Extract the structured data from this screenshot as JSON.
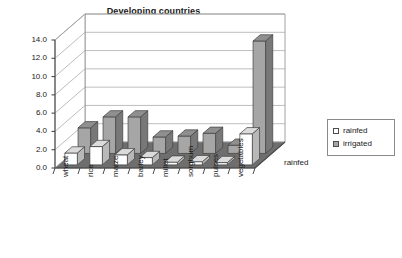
{
  "chart_data": {
    "type": "bar",
    "title": "Developing countries",
    "xlabel": "",
    "ylabel": "",
    "ylim": [
      0.0,
      14.0
    ],
    "ytick_step": 2.0,
    "yticks": [
      "14.0",
      "12.0",
      "10.0",
      "8.0",
      "6.0",
      "4.0",
      "2.0",
      "0.0"
    ],
    "grid": true,
    "projection": "3d-clustered-column",
    "legend_position": "right",
    "depth_axis_label": "rainfed",
    "categories": [
      "wheat",
      "rice",
      "maize",
      "barley",
      "millet",
      "sorghum",
      "pulses",
      "vegetables"
    ],
    "series": [
      {
        "name": "rainfed",
        "color": "#ffffff",
        "values": [
          1.3,
          2.0,
          1.1,
          0.8,
          0.3,
          0.35,
          0.25,
          3.4
        ]
      },
      {
        "name": "irrigated",
        "color": "#a6a6a6",
        "values": [
          2.8,
          4.0,
          4.0,
          1.8,
          1.9,
          2.2,
          0.9,
          12.3
        ]
      }
    ]
  },
  "legend": {
    "items": [
      {
        "label": "rainfed",
        "swatch": "rainfed"
      },
      {
        "label": "irrigated",
        "swatch": "irrigated"
      }
    ]
  },
  "colors": {
    "rainfed": "#ffffff",
    "irrigated": "#a6a6a6",
    "floor": "#6e6e6e",
    "wall": "#ffffff",
    "grid": "#a0a0a0",
    "axis": "#4d4d4d",
    "text": "#1a1a1a"
  }
}
